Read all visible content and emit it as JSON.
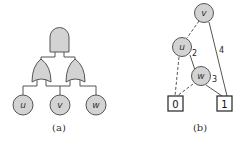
{
  "colors": {
    "node_fill": "#d3d3d3",
    "stroke": "#555555",
    "background": "#ffffff"
  },
  "panel_a": {
    "caption": "(a)",
    "gates": [
      {
        "type": "AND",
        "name": "root-and-gate"
      },
      {
        "type": "OR",
        "name": "left-or-gate"
      },
      {
        "type": "OR",
        "name": "right-or-gate"
      }
    ],
    "leaves": [
      {
        "label": "u"
      },
      {
        "label": "v"
      },
      {
        "label": "w"
      }
    ]
  },
  "panel_b": {
    "caption": "(b)",
    "nodes": [
      {
        "label": "v"
      },
      {
        "label": "u"
      },
      {
        "label": "w"
      }
    ],
    "terminals": [
      {
        "label": "0"
      },
      {
        "label": "1"
      }
    ],
    "edge_labels": {
      "u_w": "2",
      "w_1": "3",
      "v_1": "4"
    }
  }
}
